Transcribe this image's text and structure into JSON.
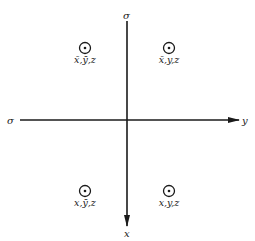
{
  "diagram": {
    "type": "symmetry-operation-diagram",
    "axes": {
      "horizontal": {
        "left_label": "σ",
        "right_label": "y",
        "direction": "right"
      },
      "vertical": {
        "top_label": "σ",
        "bottom_label": "x",
        "direction": "down"
      }
    },
    "points": [
      {
        "quadrant": "upper-left",
        "symbol": "circle-dot",
        "label": "x̄,ȳ,z"
      },
      {
        "quadrant": "upper-right",
        "symbol": "circle-dot",
        "label": "x̄,y,z"
      },
      {
        "quadrant": "lower-left",
        "symbol": "circle-dot",
        "label": "x,ȳ,z"
      },
      {
        "quadrant": "lower-right",
        "symbol": "circle-dot",
        "label": "x,y,z"
      }
    ],
    "colors": {
      "ink": "#1a1a1a",
      "background": "#ffffff"
    }
  }
}
